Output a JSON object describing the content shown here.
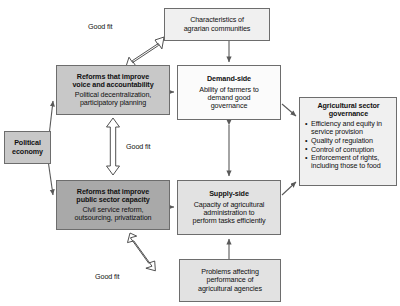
{
  "diagram": {
    "colors": {
      "box_border": "#6d6d6d",
      "arrow": "#595959",
      "hollow_arrow_fill": "#ffffff",
      "fill_white": "#fbfbfb",
      "fill_very_light": "#f0f0f0",
      "fill_light": "#e2e2e2",
      "fill_mid": "#c8c8c8",
      "fill_dark": "#a9a9a9"
    },
    "boxes": {
      "characteristics": {
        "title": "",
        "body": "Characteristics of agrarian communities",
        "body_line1": "Characteristics of",
        "body_line2": "agrarian communities"
      },
      "voice": {
        "title_line1": "Reforms that improve",
        "title_line2": "voice and accountability",
        "body_line1": "Political decentralization,",
        "body_line2": "participatory planning"
      },
      "demand": {
        "title": "Demand-side",
        "body_line1": "Ability of farmers to",
        "body_line2": "demand good",
        "body_line3": "governance"
      },
      "governance": {
        "title_line1": "Agricultural sector",
        "title_line2": "governance",
        "bullets": [
          "Efficiency and equity in service provision",
          "Quality of regulation",
          "Control of corruption",
          "Enforcement of rights, including those to food"
        ]
      },
      "political": {
        "title_line1": "Political",
        "title_line2": "economy"
      },
      "capacity": {
        "title_line1": "Reforms that improve",
        "title_line2": "public sector capacity",
        "body_line1": "Civil service reform,",
        "body_line2": "outsourcing, privatization"
      },
      "supply": {
        "title": "Supply-side",
        "body_line1": "Capacity of agricultural",
        "body_line2": "administration to",
        "body_line3": "perform tasks efficiently"
      },
      "problems": {
        "body_line1": "Problems affecting",
        "body_line2": "performance of",
        "body_line3": "agricultural agencies"
      }
    },
    "labels": {
      "fit_top": "Good fit",
      "fit_middle": "Good fit",
      "fit_bottom": "Good fit"
    }
  }
}
